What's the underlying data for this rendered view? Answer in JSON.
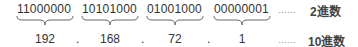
{
  "binary": [
    "11000000",
    "10101000",
    "01001000",
    "00000001"
  ],
  "decimal": [
    "192",
    "168",
    "72",
    "1"
  ],
  "separator": ".",
  "leader": "……",
  "labels": {
    "binary": "2進数",
    "decimal": "10進数"
  }
}
